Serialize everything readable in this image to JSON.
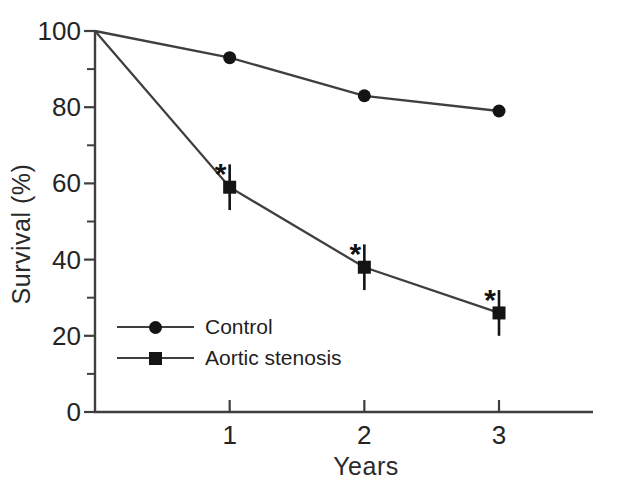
{
  "chart_data": {
    "type": "line",
    "title": "",
    "xlabel": "Years",
    "ylabel": "Survival (%)",
    "xlim": [
      0,
      3.7
    ],
    "ylim": [
      0,
      100
    ],
    "x_ticks": [
      1,
      2,
      3
    ],
    "x_tick_labels": [
      "1",
      "2",
      "3"
    ],
    "y_ticks_major": [
      0,
      20,
      40,
      60,
      80,
      100
    ],
    "y_ticks_minor": [
      10,
      30,
      50,
      70,
      90
    ],
    "grid": false,
    "legend_position": "inside-lower-left",
    "significance_symbol": "*",
    "colors": {
      "background": "#ffffff",
      "line": "#3f3f3f",
      "marker": "#141414",
      "ink": "#242424"
    },
    "series": [
      {
        "name": "Control",
        "marker": "circle",
        "x": [
          0,
          1,
          2,
          3
        ],
        "values": [
          100,
          93,
          83,
          79
        ],
        "error_bars": [
          0,
          0,
          0,
          0
        ],
        "significance": [
          false,
          false,
          false,
          false
        ]
      },
      {
        "name": "Aortic stenosis",
        "marker": "square",
        "x": [
          0,
          1,
          2,
          3
        ],
        "values": [
          100,
          59,
          38,
          26
        ],
        "error_bars": [
          0,
          6,
          6,
          6
        ],
        "significance": [
          false,
          true,
          true,
          true
        ]
      }
    ]
  }
}
